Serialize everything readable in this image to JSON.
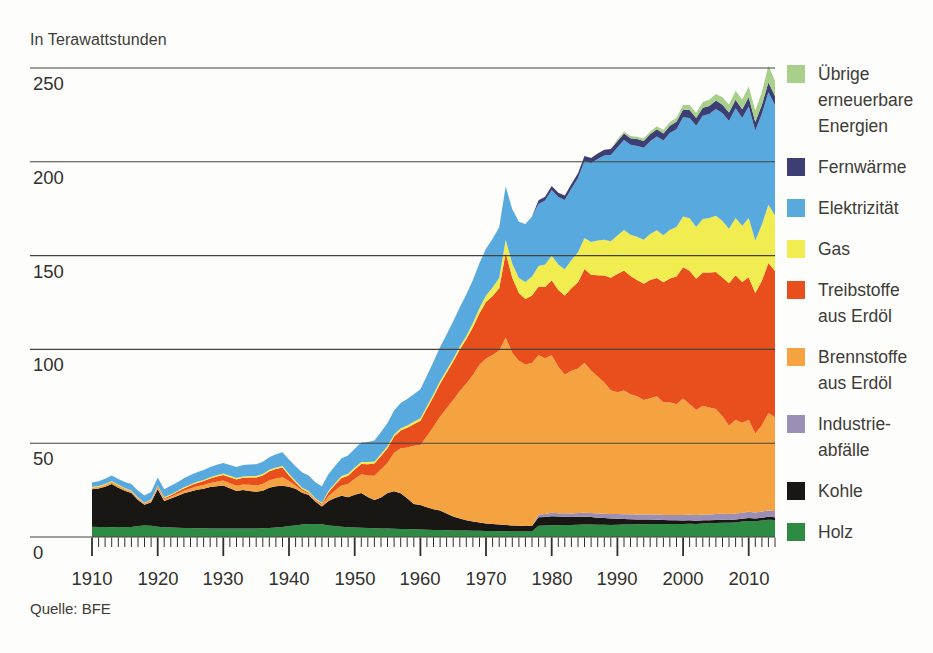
{
  "subtitle": "In Terawattstunden",
  "source": "Quelle: BFE",
  "legend": {
    "items": [
      {
        "label": "Übrige\nerneuerbare\nEnergien",
        "color": "#a8d08b",
        "series": "uebrige_erneuerbare"
      },
      {
        "label": "Fernwärme",
        "color": "#3d3f74",
        "series": "fernwaerme"
      },
      {
        "label": "Elektrizität",
        "color": "#58a9dd",
        "series": "elektrizitaet"
      },
      {
        "label": "Gas",
        "color": "#f1ec4f",
        "series": "gas"
      },
      {
        "label": "Treibstoffe\naus Erdöl",
        "color": "#e94e1d",
        "series": "treibstoffe"
      },
      {
        "label": "Brennstoffe\naus Erdöl",
        "color": "#f5a340",
        "series": "brennstoffe"
      },
      {
        "label": "Industrie-\nabfälle",
        "color": "#9c8fb6",
        "series": "industrieabfaelle"
      },
      {
        "label": "Kohle",
        "color": "#191714",
        "series": "kohle"
      },
      {
        "label": "Holz",
        "color": "#2e8b44",
        "series": "holz"
      }
    ]
  },
  "chart_data": {
    "type": "area",
    "stacked": true,
    "unit_label": "In Terawattstunden",
    "source": "Quelle: BFE",
    "x_start": 1910,
    "x_end": 2014,
    "x_major_tick_every": 10,
    "x_minor_tick_every": 1,
    "x_tick_labels": [
      1910,
      1920,
      1930,
      1940,
      1950,
      1960,
      1970,
      1980,
      1990,
      2000,
      2010
    ],
    "y_ticks": [
      0,
      50,
      100,
      150,
      200,
      250
    ],
    "ylim": [
      0,
      255
    ],
    "grid": true,
    "legend_position": "right",
    "series_bottom_to_top": [
      {
        "name": "holz",
        "label": "Holz",
        "color": "#2e8b44",
        "values": [
          5.5,
          5.4,
          5.3,
          5.2,
          5.3,
          5.2,
          5.4,
          5.8,
          6.2,
          6.0,
          5.5,
          5.2,
          5.0,
          4.9,
          4.8,
          4.8,
          4.7,
          4.7,
          4.6,
          4.6,
          4.5,
          4.5,
          4.5,
          4.5,
          4.6,
          4.6,
          4.7,
          4.8,
          5.0,
          5.3,
          5.8,
          6.2,
          6.6,
          6.9,
          7.0,
          6.8,
          6.2,
          5.8,
          5.5,
          5.2,
          5.0,
          4.9,
          4.8,
          4.7,
          4.6,
          4.5,
          4.4,
          4.3,
          4.2,
          4.1,
          4.0,
          3.9,
          3.8,
          3.7,
          3.6,
          3.5,
          3.4,
          3.4,
          3.3,
          3.3,
          3.2,
          3.2,
          3.1,
          3.1,
          3.0,
          3.0,
          3.0,
          3.0,
          6.0,
          6.1,
          6.3,
          6.3,
          6.4,
          6.4,
          6.5,
          6.6,
          6.6,
          6.5,
          6.5,
          6.4,
          6.5,
          6.6,
          6.7,
          6.8,
          6.8,
          6.9,
          7.0,
          6.9,
          6.9,
          7.0,
          7.0,
          7.1,
          7.0,
          7.2,
          7.3,
          7.5,
          7.6,
          7.6,
          7.8,
          8.2,
          8.6,
          8.4,
          8.8,
          9.2,
          9.0
        ]
      },
      {
        "name": "kohle",
        "label": "Kohle",
        "color": "#191714",
        "values": [
          20.0,
          20.5,
          21.5,
          23.0,
          21.0,
          19.5,
          18.0,
          14.0,
          11.0,
          12.5,
          20.0,
          14.0,
          15.5,
          17.0,
          18.5,
          19.5,
          20.5,
          21.0,
          22.0,
          22.5,
          23.0,
          21.5,
          20.0,
          20.5,
          20.0,
          19.5,
          20.0,
          21.5,
          22.0,
          22.0,
          21.0,
          19.5,
          17.0,
          15.5,
          12.0,
          9.5,
          13.0,
          15.0,
          16.5,
          16.0,
          17.5,
          18.5,
          16.5,
          15.0,
          16.5,
          19.0,
          20.0,
          19.0,
          16.5,
          13.5,
          13.0,
          12.0,
          11.0,
          10.5,
          9.0,
          7.5,
          6.5,
          5.5,
          5.0,
          4.5,
          4.0,
          3.8,
          3.5,
          3.3,
          3.2,
          3.0,
          2.9,
          2.8,
          4.5,
          4.6,
          4.8,
          4.6,
          4.4,
          4.2,
          4.3,
          4.2,
          4.0,
          3.8,
          3.6,
          3.4,
          3.2,
          3.0,
          2.8,
          2.6,
          2.5,
          2.4,
          2.2,
          2.1,
          2.0,
          1.9,
          1.8,
          1.8,
          1.7,
          1.7,
          1.6,
          1.6,
          1.6,
          1.5,
          1.5,
          1.5,
          1.6,
          1.5,
          1.5,
          1.6,
          1.5
        ]
      },
      {
        "name": "industrieabfaelle",
        "label": "Industrieabfälle",
        "color": "#9c8fb6",
        "values": [
          0,
          0,
          0,
          0,
          0,
          0,
          0,
          0,
          0,
          0,
          0,
          0,
          0,
          0,
          0,
          0,
          0,
          0,
          0,
          0,
          0,
          0,
          0,
          0,
          0,
          0,
          0,
          0,
          0,
          0,
          0,
          0,
          0,
          0,
          0,
          0,
          0,
          0,
          0,
          0,
          0,
          0,
          0,
          0,
          0,
          0,
          0,
          0,
          0,
          0,
          0,
          0,
          0,
          0,
          0,
          0,
          0,
          0,
          0,
          0,
          0,
          0,
          0,
          0,
          0,
          0,
          0,
          0,
          1.5,
          1.6,
          1.8,
          1.8,
          1.9,
          2.0,
          2.0,
          2.1,
          2.2,
          2.2,
          2.3,
          2.4,
          2.5,
          2.5,
          2.6,
          2.6,
          2.7,
          2.7,
          2.8,
          2.8,
          2.9,
          2.9,
          3.0,
          3.0,
          3.0,
          3.1,
          3.1,
          3.1,
          3.2,
          3.2,
          3.2,
          3.2,
          3.3,
          3.2,
          3.3,
          3.3,
          3.3
        ]
      },
      {
        "name": "brennstoffe",
        "label": "Brennstoffe aus Erdöl",
        "color": "#f5a340",
        "values": [
          0.8,
          0.8,
          0.9,
          1.0,
          0.9,
          0.8,
          0.7,
          0.6,
          0.5,
          0.7,
          1.0,
          0.9,
          1.0,
          1.2,
          1.4,
          1.6,
          1.8,
          2.0,
          2.2,
          2.4,
          2.6,
          2.7,
          2.8,
          3.0,
          3.2,
          3.4,
          3.6,
          3.9,
          4.2,
          4.5,
          3.0,
          1.8,
          1.2,
          0.8,
          0.6,
          0.8,
          2.5,
          4.0,
          5.5,
          7.0,
          8.5,
          10.0,
          11.5,
          13.0,
          15.0,
          16.0,
          20.5,
          24.0,
          27.0,
          31.0,
          32.0,
          38.0,
          44.0,
          50.0,
          56.0,
          62.0,
          68.0,
          73.0,
          78.0,
          84.0,
          88.0,
          90.0,
          93.0,
          100.0,
          92.0,
          88.0,
          86.0,
          87.0,
          85.0,
          83.0,
          84.0,
          78.0,
          74.0,
          76.0,
          77.0,
          80.0,
          76.0,
          73.0,
          70.0,
          66.0,
          65.0,
          66.0,
          64.0,
          63.0,
          61.0,
          62.0,
          63.0,
          60.0,
          60.0,
          59.0,
          62.0,
          59.0,
          56.0,
          58.0,
          57.0,
          56.0,
          52.0,
          47.0,
          50.0,
          48.0,
          49.0,
          42.0,
          46.0,
          52.0,
          50.0
        ]
      },
      {
        "name": "treibstoffe",
        "label": "Treibstoffe aus Erdöl",
        "color": "#e94e1d",
        "values": [
          0.1,
          0.1,
          0.2,
          0.2,
          0.2,
          0.2,
          0.3,
          0.3,
          0.3,
          0.4,
          0.5,
          0.6,
          0.8,
          1.0,
          1.2,
          1.5,
          1.8,
          2.1,
          2.4,
          2.7,
          3.0,
          3.2,
          3.4,
          3.6,
          3.9,
          4.2,
          4.5,
          4.8,
          5.0,
          5.2,
          3.0,
          1.5,
          0.8,
          0.6,
          0.5,
          0.6,
          2.0,
          3.0,
          4.0,
          4.5,
          5.0,
          5.5,
          6.0,
          6.5,
          7.0,
          7.8,
          8.6,
          9.5,
          10.5,
          11.5,
          13.0,
          14.5,
          16.0,
          17.5,
          19.0,
          20.5,
          22.0,
          23.5,
          25.5,
          27.5,
          30.0,
          31.5,
          33.0,
          45.0,
          40.0,
          36.0,
          35.0,
          36.0,
          36.5,
          38.0,
          40.0,
          41.0,
          42.0,
          44.0,
          46.0,
          50.0,
          51.0,
          54.0,
          57.0,
          60.0,
          63.0,
          64.0,
          63.0,
          62.0,
          62.0,
          63.0,
          63.0,
          64.0,
          66.0,
          68.0,
          70.0,
          71.0,
          70.0,
          71.0,
          72.0,
          73.0,
          74.0,
          76.0,
          77.0,
          75.0,
          76.0,
          75.0,
          77.0,
          80.0,
          78.0
        ]
      },
      {
        "name": "gas",
        "label": "Gas",
        "color": "#f1ec4f",
        "values": [
          0.4,
          0.4,
          0.4,
          0.5,
          0.5,
          0.4,
          0.4,
          0.4,
          0.3,
          0.4,
          0.5,
          0.5,
          0.5,
          0.5,
          0.6,
          0.6,
          0.6,
          0.6,
          0.7,
          0.7,
          0.7,
          0.7,
          0.7,
          0.7,
          0.8,
          0.8,
          0.8,
          0.8,
          0.9,
          0.9,
          0.9,
          0.8,
          0.7,
          0.7,
          0.6,
          0.6,
          0.8,
          0.9,
          1.0,
          1.0,
          1.0,
          1.0,
          1.1,
          1.1,
          1.1,
          1.2,
          1.2,
          1.2,
          1.3,
          1.3,
          1.3,
          1.3,
          1.4,
          1.4,
          1.4,
          1.5,
          1.6,
          1.8,
          2.2,
          2.8,
          3.5,
          4.5,
          5.5,
          7.0,
          7.5,
          8.0,
          9.0,
          10.0,
          11.0,
          12.0,
          13.0,
          13.5,
          14.0,
          15.0,
          16.0,
          16.5,
          17.5,
          18.5,
          19.0,
          19.5,
          20.5,
          21.5,
          22.0,
          23.0,
          23.5,
          24.5,
          25.5,
          25.0,
          26.0,
          26.5,
          27.0,
          28.0,
          27.5,
          28.5,
          29.0,
          30.0,
          30.0,
          29.0,
          30.5,
          30.0,
          31.5,
          28.0,
          30.0,
          31.0,
          29.5
        ]
      },
      {
        "name": "elektrizitaet",
        "label": "Elektrizität",
        "color": "#58a9dd",
        "values": [
          2.3,
          2.5,
          2.7,
          2.9,
          3.0,
          3.2,
          3.4,
          3.6,
          3.8,
          4.0,
          4.2,
          4.3,
          4.5,
          4.6,
          4.8,
          5.0,
          5.1,
          5.3,
          5.4,
          5.6,
          5.7,
          5.8,
          5.9,
          6.0,
          6.2,
          6.3,
          6.5,
          6.7,
          7.0,
          7.3,
          7.6,
          7.9,
          8.1,
          8.3,
          8.5,
          8.8,
          9.0,
          9.2,
          9.5,
          9.7,
          10.0,
          10.4,
          10.8,
          11.2,
          11.7,
          12.2,
          12.8,
          13.4,
          14.0,
          14.7,
          15.5,
          16.3,
          17.2,
          18.1,
          19.0,
          20.0,
          21.0,
          22.0,
          23.0,
          24.0,
          25.0,
          26.0,
          27.0,
          28.5,
          29.0,
          30.0,
          31.0,
          32.0,
          33.0,
          34.0,
          35.0,
          36.0,
          37.0,
          38.0,
          39.5,
          41.0,
          42.0,
          43.5,
          45.0,
          46.0,
          47.0,
          48.0,
          48.0,
          48.5,
          49.0,
          49.5,
          50.0,
          50.5,
          51.5,
          52.0,
          53.0,
          53.5,
          54.0,
          55.0,
          55.5,
          57.0,
          57.5,
          57.5,
          58.5,
          57.5,
          59.5,
          58.5,
          59.0,
          60.0,
          59.0
        ]
      },
      {
        "name": "fernwaerme",
        "label": "Fernwärme",
        "color": "#3d3f74",
        "values": [
          0,
          0,
          0,
          0,
          0,
          0,
          0,
          0,
          0,
          0,
          0,
          0,
          0,
          0,
          0,
          0,
          0,
          0,
          0,
          0,
          0,
          0,
          0,
          0,
          0,
          0,
          0,
          0,
          0,
          0,
          0,
          0,
          0,
          0,
          0,
          0,
          0,
          0,
          0,
          0,
          0,
          0,
          0,
          0,
          0,
          0,
          0,
          0,
          0,
          0,
          0,
          0,
          0,
          0,
          0,
          0,
          0,
          0,
          0,
          0,
          0,
          0,
          0,
          0,
          0,
          0,
          0,
          0,
          2.0,
          2.1,
          2.2,
          2.3,
          2.4,
          2.5,
          2.6,
          2.7,
          2.8,
          2.9,
          3.0,
          3.1,
          3.3,
          3.5,
          3.5,
          3.6,
          3.6,
          3.7,
          3.8,
          3.8,
          3.9,
          4.0,
          4.0,
          4.2,
          4.1,
          4.3,
          4.3,
          4.4,
          4.5,
          4.4,
          4.6,
          4.6,
          4.9,
          4.6,
          4.8,
          5.1,
          4.8
        ]
      },
      {
        "name": "uebrige_erneuerbare",
        "label": "Übrige erneuerbare Energien",
        "color": "#a8d08b",
        "values": [
          0,
          0,
          0,
          0,
          0,
          0,
          0,
          0,
          0,
          0,
          0,
          0,
          0,
          0,
          0,
          0,
          0,
          0,
          0,
          0,
          0,
          0,
          0,
          0,
          0,
          0,
          0,
          0,
          0,
          0,
          0,
          0,
          0,
          0,
          0,
          0,
          0,
          0,
          0,
          0,
          0,
          0,
          0,
          0,
          0,
          0,
          0,
          0,
          0,
          0,
          0,
          0,
          0,
          0,
          0,
          0,
          0,
          0,
          0,
          0,
          0,
          0,
          0,
          0,
          0,
          0,
          0,
          0,
          0,
          0,
          0,
          0,
          0,
          0,
          0,
          0,
          0,
          0,
          0,
          0,
          1.0,
          1.1,
          1.2,
          1.3,
          1.4,
          1.5,
          1.6,
          1.8,
          2.0,
          2.2,
          2.4,
          2.6,
          2.8,
          3.0,
          3.3,
          3.6,
          4.0,
          4.4,
          4.8,
          5.2,
          5.8,
          6.2,
          6.8,
          9.0,
          8.0
        ]
      }
    ]
  }
}
